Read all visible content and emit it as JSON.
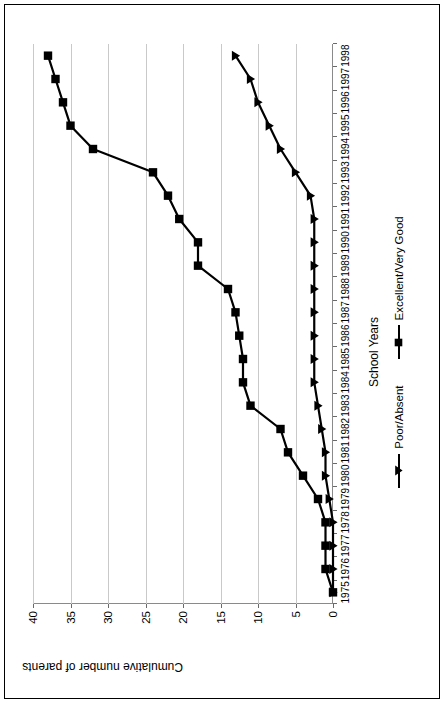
{
  "chart_data": {
    "type": "line",
    "title": "",
    "xlabel": "School Years",
    "ylabel": "Cumulative number of parents",
    "categories": [
      "1975",
      "1976",
      "1977",
      "1978",
      "1979",
      "1980",
      "1981",
      "1982",
      "1983",
      "1984",
      "1985",
      "1986",
      "1987",
      "1988",
      "1989",
      "1990",
      "1991",
      "1992",
      "1993",
      "1994",
      "1995",
      "1996",
      "1997",
      "1998"
    ],
    "ylim": [
      0,
      40
    ],
    "yticks": [
      0,
      5,
      10,
      15,
      20,
      25,
      30,
      35,
      40
    ],
    "ytick_labels": [
      "0",
      "5",
      "10",
      "15",
      "20",
      "25",
      "30",
      "35",
      "40"
    ],
    "grid": true,
    "legend_position": "bottom",
    "series": [
      {
        "name": "Poor/Absent",
        "marker": "triangle",
        "color": "#000000",
        "values": [
          0,
          0,
          0,
          0,
          0.5,
          1,
          1,
          1.5,
          2,
          2.5,
          2.5,
          2.5,
          2.5,
          2.5,
          2.5,
          2.5,
          2.5,
          3,
          5,
          7,
          8.5,
          10,
          11,
          13
        ]
      },
      {
        "name": "Excellent/Very Good",
        "marker": "square",
        "color": "#000000",
        "values": [
          0,
          1,
          1,
          1,
          2,
          4,
          6,
          7,
          11,
          12,
          12,
          12.5,
          13,
          14,
          18,
          18,
          20.5,
          22,
          24,
          32,
          35,
          36,
          37,
          38
        ]
      }
    ]
  },
  "legend": {
    "items": [
      {
        "label": "Poor/Absent",
        "marker": "triangle-marker"
      },
      {
        "label": "Excellent/Very Good",
        "marker": "square-marker"
      }
    ]
  },
  "axes": {
    "x_title": "School Years",
    "y_title": "Cumulative number of parents"
  }
}
